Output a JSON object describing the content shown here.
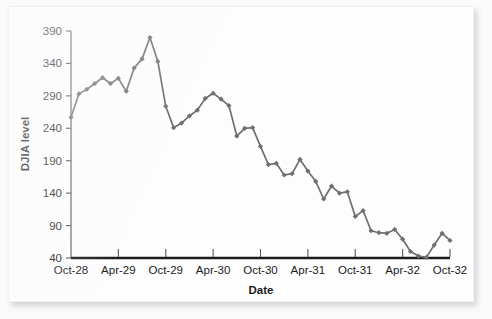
{
  "chart_data": {
    "type": "line",
    "title": "",
    "subtitle": "",
    "xlabel": "Date",
    "ylabel": "DJIA level",
    "grid": false,
    "legend": false,
    "legend_position": "none",
    "series_color": "#6f6f71",
    "marker": "diamond",
    "ylim": [
      40,
      390
    ],
    "yticks": [
      40,
      90,
      140,
      190,
      240,
      290,
      340,
      390
    ],
    "ytick_labels": [
      "40",
      "90",
      "140",
      "190",
      "240",
      "290",
      "340",
      "390"
    ],
    "xticks": [
      "Oct-28",
      "Apr-29",
      "Oct-29",
      "Apr-30",
      "Oct-30",
      "Apr-31",
      "Oct-31",
      "Apr-32",
      "Oct-32"
    ],
    "xtick_labels": [
      "Oct-28",
      "Apr-29",
      "Oct-29",
      "Apr-30",
      "Oct-30",
      "Apr-31",
      "Oct-31",
      "Apr-32",
      "Oct-32"
    ],
    "x": [
      "Oct-28",
      "Nov-28",
      "Dec-28",
      "Jan-29",
      "Feb-29",
      "Mar-29",
      "Apr-29",
      "May-29",
      "Jun-29",
      "Jul-29",
      "Aug-29",
      "Sep-29",
      "Oct-29",
      "Nov-29",
      "Dec-29",
      "Jan-30",
      "Feb-30",
      "Mar-30",
      "Apr-30",
      "May-30",
      "Jun-30",
      "Jul-30",
      "Aug-30",
      "Sep-30",
      "Oct-30",
      "Nov-30",
      "Dec-30",
      "Jan-31",
      "Feb-31",
      "Mar-31",
      "Apr-31",
      "May-31",
      "Jun-31",
      "Jul-31",
      "Aug-31",
      "Sep-31",
      "Oct-31",
      "Nov-31",
      "Dec-31",
      "Jan-32",
      "Feb-32",
      "Mar-32",
      "Apr-32",
      "May-32",
      "Jun-32",
      "Jul-32",
      "Aug-32",
      "Sep-32",
      "Oct-32"
    ],
    "values": [
      257,
      293,
      300,
      309,
      318,
      309,
      317,
      297,
      333,
      347,
      380,
      343,
      274,
      241,
      248,
      259,
      268,
      286,
      294,
      285,
      275,
      228,
      240,
      241,
      212,
      184,
      186,
      168,
      170,
      192,
      174,
      158,
      131,
      151,
      140,
      142,
      104,
      113,
      82,
      79,
      78,
      84,
      69,
      50,
      43,
      41,
      60,
      78,
      67
    ],
    "first_value": 257,
    "peak_value": 380,
    "peak_label": "Aug-29",
    "trough_value": 41,
    "trough_label": "Jul-32",
    "last_value": 67
  },
  "axes": {
    "x_title": "Date",
    "y_title": "DJIA level"
  }
}
